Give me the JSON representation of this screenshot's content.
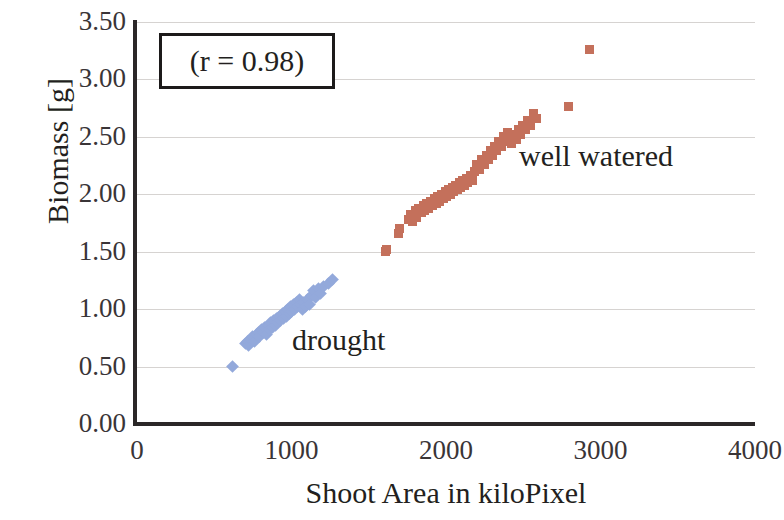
{
  "chart_data": {
    "type": "scatter",
    "title": "",
    "xlabel": "Shoot Area in kiloPixel",
    "ylabel": "Biomass [g]",
    "xlim": [
      0,
      4000
    ],
    "ylim": [
      0.0,
      3.5
    ],
    "xticks": [
      "0",
      "1000",
      "2000",
      "3000",
      "4000"
    ],
    "xtick_values": [
      0,
      1000,
      2000,
      3000,
      4000
    ],
    "yticks": [
      "0.00",
      "0.50",
      "1.00",
      "1.50",
      "2.00",
      "2.50",
      "3.00",
      "3.50"
    ],
    "ytick_values": [
      0.0,
      0.5,
      1.0,
      1.5,
      2.0,
      2.5,
      3.0,
      3.5
    ],
    "grid": "horizontal",
    "legend_position": "inline-annotations",
    "annotations": [
      {
        "text": "(r = 0.98)",
        "kind": "boxed-stat"
      },
      {
        "text": "drought",
        "kind": "series-label",
        "series": "drought"
      },
      {
        "text": "well watered",
        "kind": "series-label",
        "series": "well watered"
      }
    ],
    "series": [
      {
        "name": "drought",
        "color": "#93a9db",
        "marker": "diamond",
        "points": [
          [
            615,
            0.5
          ],
          [
            700,
            0.7
          ],
          [
            712,
            0.72
          ],
          [
            720,
            0.68
          ],
          [
            735,
            0.74
          ],
          [
            748,
            0.76
          ],
          [
            760,
            0.72
          ],
          [
            772,
            0.78
          ],
          [
            784,
            0.8
          ],
          [
            795,
            0.76
          ],
          [
            806,
            0.82
          ],
          [
            818,
            0.8
          ],
          [
            828,
            0.84
          ],
          [
            838,
            0.78
          ],
          [
            848,
            0.86
          ],
          [
            858,
            0.82
          ],
          [
            866,
            0.88
          ],
          [
            876,
            0.84
          ],
          [
            886,
            0.9
          ],
          [
            894,
            0.86
          ],
          [
            904,
            0.92
          ],
          [
            912,
            0.88
          ],
          [
            922,
            0.94
          ],
          [
            930,
            0.9
          ],
          [
            940,
            0.96
          ],
          [
            948,
            0.92
          ],
          [
            958,
            0.98
          ],
          [
            966,
            0.94
          ],
          [
            976,
            1.0
          ],
          [
            984,
            0.96
          ],
          [
            994,
            1.02
          ],
          [
            1002,
            0.98
          ],
          [
            1012,
            1.04
          ],
          [
            1020,
            1.0
          ],
          [
            1030,
            1.06
          ],
          [
            1040,
            1.02
          ],
          [
            1050,
            1.08
          ],
          [
            1060,
            1.04
          ],
          [
            1070,
            1.0
          ],
          [
            1080,
            1.06
          ],
          [
            1092,
            1.02
          ],
          [
            1104,
            1.08
          ],
          [
            1118,
            1.04
          ],
          [
            1130,
            1.12
          ],
          [
            1142,
            1.16
          ],
          [
            1158,
            1.1
          ],
          [
            1172,
            1.18
          ],
          [
            1190,
            1.14
          ],
          [
            1210,
            1.2
          ],
          [
            1240,
            1.22
          ],
          [
            1265,
            1.26
          ]
        ]
      },
      {
        "name": "well watered",
        "color": "#c4705b",
        "marker": "square",
        "points": [
          [
            1610,
            1.5
          ],
          [
            1618,
            1.52
          ],
          [
            1690,
            1.66
          ],
          [
            1700,
            1.7
          ],
          [
            1760,
            1.78
          ],
          [
            1770,
            1.82
          ],
          [
            1782,
            1.76
          ],
          [
            1800,
            1.86
          ],
          [
            1812,
            1.8
          ],
          [
            1824,
            1.88
          ],
          [
            1840,
            1.84
          ],
          [
            1852,
            1.9
          ],
          [
            1862,
            1.86
          ],
          [
            1876,
            1.92
          ],
          [
            1888,
            1.88
          ],
          [
            1900,
            1.94
          ],
          [
            1910,
            1.9
          ],
          [
            1924,
            1.96
          ],
          [
            1936,
            1.92
          ],
          [
            1948,
            1.98
          ],
          [
            1958,
            1.94
          ],
          [
            1970,
            2.0
          ],
          [
            1982,
            1.96
          ],
          [
            1994,
            2.02
          ],
          [
            2004,
            1.98
          ],
          [
            2016,
            2.04
          ],
          [
            2028,
            2.0
          ],
          [
            2040,
            2.06
          ],
          [
            2050,
            2.02
          ],
          [
            2062,
            2.08
          ],
          [
            2074,
            2.04
          ],
          [
            2086,
            2.1
          ],
          [
            2096,
            2.06
          ],
          [
            2108,
            2.12
          ],
          [
            2120,
            2.08
          ],
          [
            2130,
            2.14
          ],
          [
            2142,
            2.1
          ],
          [
            2156,
            2.16
          ],
          [
            2170,
            2.12
          ],
          [
            2184,
            2.2
          ],
          [
            2200,
            2.26
          ],
          [
            2215,
            2.22
          ],
          [
            2230,
            2.3
          ],
          [
            2246,
            2.26
          ],
          [
            2260,
            2.34
          ],
          [
            2274,
            2.3
          ],
          [
            2288,
            2.38
          ],
          [
            2300,
            2.34
          ],
          [
            2314,
            2.42
          ],
          [
            2328,
            2.38
          ],
          [
            2342,
            2.46
          ],
          [
            2356,
            2.42
          ],
          [
            2370,
            2.5
          ],
          [
            2384,
            2.46
          ],
          [
            2398,
            2.54
          ],
          [
            2412,
            2.5
          ],
          [
            2426,
            2.44
          ],
          [
            2440,
            2.52
          ],
          [
            2454,
            2.48
          ],
          [
            2468,
            2.56
          ],
          [
            2482,
            2.52
          ],
          [
            2496,
            2.6
          ],
          [
            2512,
            2.56
          ],
          [
            2528,
            2.64
          ],
          [
            2546,
            2.6
          ],
          [
            2566,
            2.7
          ],
          [
            2584,
            2.66
          ],
          [
            2790,
            2.76
          ],
          [
            2930,
            3.26
          ]
        ]
      }
    ]
  }
}
